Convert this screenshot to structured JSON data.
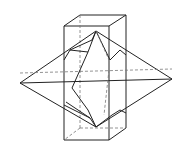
{
  "figure": {
    "stroke_color": "#222222",
    "hidden_line_color": "#777777",
    "background": "#ffffff"
  }
}
